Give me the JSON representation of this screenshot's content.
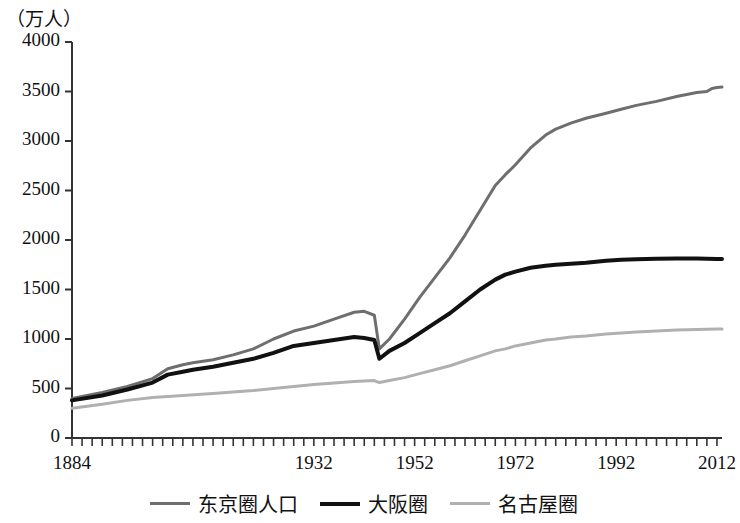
{
  "chart_data": {
    "type": "line",
    "title": "",
    "subtitle": "",
    "unit_label": "（万人）",
    "xlabel": "",
    "ylabel": "",
    "xlim": [
      1884,
      2013
    ],
    "ylim": [
      0,
      4000
    ],
    "grid": false,
    "legend_position": "bottom",
    "y_ticks": [
      4000,
      3500,
      3000,
      2500,
      2000,
      1500,
      1000,
      500,
      0
    ],
    "y_tick_labels": [
      "4000",
      "3500",
      "3000",
      "2500",
      "2000",
      "1500",
      "1000",
      "500",
      "0"
    ],
    "x_ticks": [
      1884,
      1932,
      1952,
      1972,
      1992,
      2012
    ],
    "x_tick_labels": [
      "1884",
      "1932",
      "1952",
      "1972",
      "1992",
      "2012"
    ],
    "x_minor_tick_interval": 2,
    "colors": {
      "tokyo": "#6e6e6e",
      "osaka": "#111111",
      "nagoya": "#b0b0b0",
      "axis": "#333333"
    },
    "series": [
      {
        "name": "东京圈人口",
        "color": "#6e6e6e",
        "width": 3,
        "x": [
          1884,
          1890,
          1895,
          1900,
          1903,
          1906,
          1908,
          1912,
          1916,
          1920,
          1924,
          1928,
          1932,
          1936,
          1940,
          1942,
          1944,
          1945,
          1947,
          1950,
          1953,
          1956,
          1959,
          1962,
          1965,
          1968,
          1970,
          1972,
          1975,
          1978,
          1980,
          1983,
          1986,
          1990,
          1993,
          1996,
          2000,
          2004,
          2008,
          2010,
          2011,
          2012,
          2013
        ],
        "y": [
          400,
          460,
          520,
          600,
          700,
          740,
          760,
          790,
          840,
          900,
          1000,
          1080,
          1130,
          1200,
          1270,
          1280,
          1240,
          900,
          1000,
          1200,
          1420,
          1620,
          1820,
          2050,
          2300,
          2550,
          2660,
          2760,
          2930,
          3060,
          3120,
          3180,
          3230,
          3280,
          3320,
          3360,
          3400,
          3450,
          3490,
          3500,
          3530,
          3540,
          3545
        ]
      },
      {
        "name": "大阪圈",
        "color": "#111111",
        "width": 4,
        "x": [
          1884,
          1890,
          1895,
          1900,
          1903,
          1906,
          1908,
          1912,
          1916,
          1920,
          1924,
          1928,
          1932,
          1936,
          1940,
          1942,
          1944,
          1945,
          1947,
          1950,
          1953,
          1956,
          1959,
          1962,
          1965,
          1968,
          1970,
          1972,
          1975,
          1978,
          1980,
          1983,
          1986,
          1990,
          1993,
          1996,
          2000,
          2004,
          2008,
          2010,
          2012,
          2013
        ],
        "y": [
          380,
          430,
          490,
          560,
          640,
          670,
          690,
          720,
          760,
          800,
          860,
          930,
          960,
          990,
          1020,
          1010,
          990,
          800,
          880,
          960,
          1060,
          1160,
          1260,
          1380,
          1500,
          1600,
          1650,
          1680,
          1720,
          1740,
          1750,
          1760,
          1770,
          1790,
          1800,
          1805,
          1810,
          1812,
          1812,
          1810,
          1808,
          1808
        ]
      },
      {
        "name": "名古屋圈",
        "color": "#b0b0b0",
        "width": 3,
        "x": [
          1884,
          1890,
          1895,
          1900,
          1906,
          1912,
          1920,
          1924,
          1928,
          1932,
          1936,
          1940,
          1944,
          1945,
          1947,
          1950,
          1953,
          1956,
          1959,
          1962,
          1965,
          1968,
          1970,
          1972,
          1975,
          1978,
          1980,
          1983,
          1986,
          1990,
          1993,
          1996,
          2000,
          2004,
          2008,
          2010,
          2012,
          2013
        ],
        "y": [
          300,
          340,
          380,
          410,
          430,
          450,
          480,
          500,
          520,
          540,
          555,
          570,
          580,
          560,
          580,
          610,
          650,
          690,
          730,
          780,
          830,
          880,
          900,
          930,
          960,
          990,
          1000,
          1020,
          1030,
          1050,
          1060,
          1070,
          1080,
          1090,
          1095,
          1098,
          1100,
          1100
        ]
      }
    ]
  },
  "legend": {
    "items": [
      {
        "label": "东京圈人口",
        "color": "#6e6e6e",
        "thickness": 3
      },
      {
        "label": "大阪圈",
        "color": "#111111",
        "thickness": 4
      },
      {
        "label": "名古屋圈",
        "color": "#b0b0b0",
        "thickness": 3
      }
    ]
  }
}
